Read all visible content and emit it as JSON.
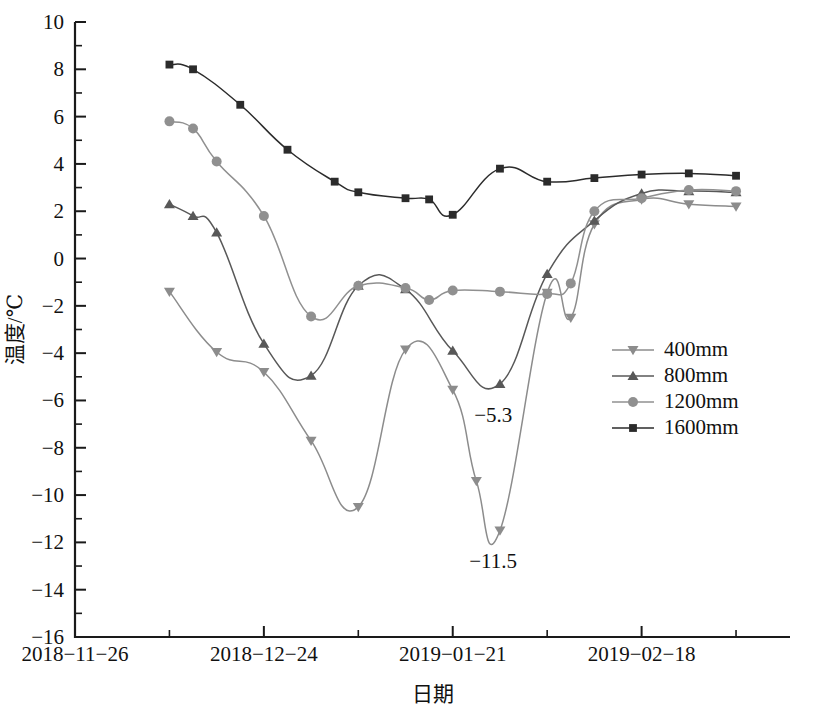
{
  "chart_data": {
    "type": "line",
    "title": "",
    "xlabel": "日期",
    "ylabel": "温度/℃",
    "ylim": [
      -16,
      10
    ],
    "ytick_step": 2,
    "yticks": [
      10,
      8,
      6,
      4,
      2,
      0,
      -2,
      -4,
      -6,
      -8,
      -10,
      -12,
      -14,
      -16
    ],
    "ytick_labels": [
      "10",
      "8",
      "6",
      "4",
      "2",
      "0",
      "-2",
      "-4",
      "-6",
      "-8",
      "-10",
      "-12",
      "-14",
      "-16"
    ],
    "minor_yticks": [
      9,
      7,
      5,
      3,
      1,
      -1,
      -3,
      -5,
      -7,
      -9,
      -11,
      -13,
      -15
    ],
    "xlim_days": [
      0,
      106
    ],
    "xticks_days": [
      0,
      14,
      28,
      42,
      56,
      70,
      84,
      98
    ],
    "xtick_major_days": [
      0,
      28,
      56,
      84
    ],
    "xtick_labels": [
      "2018-11-26",
      "2018-12-24",
      "2019-01-21",
      "2019-02-18"
    ],
    "grid": false,
    "legend_position": "center-right",
    "series": [
      {
        "name": "400mm",
        "marker": "triangle-down",
        "color": "#8c8c8c",
        "points": [
          {
            "x": 14,
            "y": -1.4
          },
          {
            "x": 21,
            "y": -3.95
          },
          {
            "x": 28,
            "y": -4.8
          },
          {
            "x": 35,
            "y": -7.7
          },
          {
            "x": 42,
            "y": -10.5
          },
          {
            "x": 49,
            "y": -3.85
          },
          {
            "x": 56,
            "y": -5.55
          },
          {
            "x": 59.5,
            "y": -9.4
          },
          {
            "x": 63,
            "y": -11.5
          },
          {
            "x": 70,
            "y": -1.45
          },
          {
            "x": 73.5,
            "y": -2.5
          },
          {
            "x": 77,
            "y": 1.45
          },
          {
            "x": 84,
            "y": 2.5
          },
          {
            "x": 91,
            "y": 2.3
          },
          {
            "x": 98,
            "y": 2.2
          }
        ]
      },
      {
        "name": "800mm",
        "marker": "triangle-up",
        "color": "#585858",
        "points": [
          {
            "x": 14,
            "y": 2.3
          },
          {
            "x": 17.5,
            "y": 1.8
          },
          {
            "x": 21,
            "y": 1.1
          },
          {
            "x": 28,
            "y": -3.6
          },
          {
            "x": 35,
            "y": -4.95
          },
          {
            "x": 42,
            "y": -1.15
          },
          {
            "x": 49,
            "y": -1.3
          },
          {
            "x": 56,
            "y": -3.9
          },
          {
            "x": 63,
            "y": -5.3
          },
          {
            "x": 70,
            "y": -0.65
          },
          {
            "x": 77,
            "y": 1.6
          },
          {
            "x": 84,
            "y": 2.75
          },
          {
            "x": 91,
            "y": 2.85
          },
          {
            "x": 98,
            "y": 2.8
          }
        ]
      },
      {
        "name": "1200mm",
        "marker": "circle",
        "color": "#909090",
        "points": [
          {
            "x": 14,
            "y": 5.8
          },
          {
            "x": 17.5,
            "y": 5.5
          },
          {
            "x": 21,
            "y": 4.1
          },
          {
            "x": 28,
            "y": 1.8
          },
          {
            "x": 35,
            "y": -2.45
          },
          {
            "x": 42,
            "y": -1.15
          },
          {
            "x": 49,
            "y": -1.25
          },
          {
            "x": 52.5,
            "y": -1.75
          },
          {
            "x": 56,
            "y": -1.35
          },
          {
            "x": 63,
            "y": -1.4
          },
          {
            "x": 70,
            "y": -1.5
          },
          {
            "x": 73.5,
            "y": -1.05
          },
          {
            "x": 77,
            "y": 2.0
          },
          {
            "x": 84,
            "y": 2.55
          },
          {
            "x": 91,
            "y": 2.9
          },
          {
            "x": 98,
            "y": 2.85
          }
        ]
      },
      {
        "name": "1600mm",
        "marker": "square",
        "color": "#2b2b2b",
        "points": [
          {
            "x": 14,
            "y": 8.2
          },
          {
            "x": 17.5,
            "y": 8.0
          },
          {
            "x": 24.5,
            "y": 6.5
          },
          {
            "x": 31.5,
            "y": 4.6
          },
          {
            "x": 38.5,
            "y": 3.25
          },
          {
            "x": 42,
            "y": 2.8
          },
          {
            "x": 49,
            "y": 2.55
          },
          {
            "x": 52.5,
            "y": 2.5
          },
          {
            "x": 56,
            "y": 1.85
          },
          {
            "x": 63,
            "y": 3.8
          },
          {
            "x": 70,
            "y": 3.25
          },
          {
            "x": 77,
            "y": 3.4
          },
          {
            "x": 84,
            "y": 3.55
          },
          {
            "x": 91,
            "y": 3.6
          },
          {
            "x": 98,
            "y": 3.5
          }
        ]
      }
    ],
    "annotations": [
      {
        "text": "-5.3",
        "x": 62,
        "y": -6.9
      },
      {
        "text": "-11.5",
        "x": 62,
        "y": -13.1
      }
    ]
  },
  "legend": {
    "entries": [
      {
        "label": "400mm"
      },
      {
        "label": "800mm"
      },
      {
        "label": "1200mm"
      },
      {
        "label": "1600mm"
      }
    ]
  },
  "axes": {
    "y_title": "温度/℃",
    "x_title": "日期"
  }
}
